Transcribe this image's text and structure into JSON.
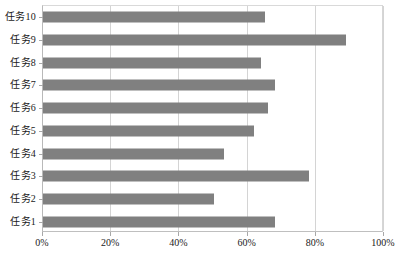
{
  "chart_data": {
    "type": "bar",
    "orientation": "horizontal",
    "title": "",
    "xlabel": "",
    "ylabel": "",
    "xlim": [
      0,
      100
    ],
    "xticks": [
      "0%",
      "20%",
      "40%",
      "60%",
      "80%",
      "100%"
    ],
    "xtick_values": [
      0,
      20,
      40,
      60,
      80,
      100
    ],
    "grid": true,
    "grid_axis": "x",
    "legend": false,
    "bar_color": "#808080",
    "categories": [
      "任务1",
      "任务2",
      "任务3",
      "任务4",
      "任务5",
      "任务6",
      "任务7",
      "任务8",
      "任务9",
      "任务10"
    ],
    "values": [
      68,
      50,
      78,
      53,
      62,
      66,
      68,
      64,
      89,
      65
    ],
    "series": [
      {
        "name": "",
        "points": [
          {
            "category": "任务10",
            "value": 65
          },
          {
            "category": "任务9",
            "value": 89
          },
          {
            "category": "任务8",
            "value": 64
          },
          {
            "category": "任务7",
            "value": 68
          },
          {
            "category": "任务6",
            "value": 66
          },
          {
            "category": "任务5",
            "value": 62
          },
          {
            "category": "任务4",
            "value": 53
          },
          {
            "category": "任务3",
            "value": 78
          },
          {
            "category": "任务2",
            "value": 50
          },
          {
            "category": "任务1",
            "value": 68
          }
        ]
      }
    ],
    "display_order_top_to_bottom": [
      "任务10",
      "任务9",
      "任务8",
      "任务7",
      "任务6",
      "任务5",
      "任务4",
      "任务3",
      "任务2",
      "任务1"
    ]
  },
  "colors": {
    "bar": "#808080",
    "gridline": "#d4d4d4",
    "axis": "#b9b9b9",
    "text": "#1a1a1a",
    "background": "#ffffff"
  }
}
